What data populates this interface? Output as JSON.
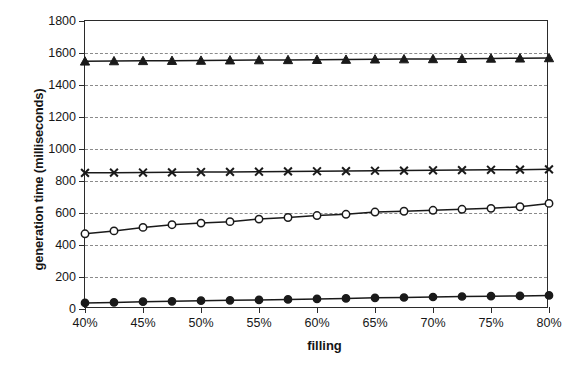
{
  "chart_data": {
    "type": "line",
    "title": "",
    "xlabel": "filling",
    "ylabel": "generation time (milliseconds)",
    "xlim": [
      40,
      80
    ],
    "ylim": [
      0,
      1800
    ],
    "ytick_step": 200,
    "xtick_step": 5,
    "grid": "horizontal-dashed",
    "legend": "none",
    "x": [
      40,
      42.5,
      45,
      47.5,
      50,
      52.5,
      55,
      57.5,
      60,
      62.5,
      65,
      67.5,
      70,
      72.5,
      75,
      77.5,
      80
    ],
    "xtick_labels": [
      "40%",
      "45%",
      "50%",
      "55%",
      "60%",
      "65%",
      "70%",
      "75%",
      "80%"
    ],
    "ytick_labels": [
      "0",
      "200",
      "400",
      "600",
      "800",
      "1000",
      "1200",
      "1400",
      "1600",
      "1800"
    ],
    "series": [
      {
        "name": "triangle-series",
        "marker": "filled-triangle",
        "color": "#1a1a1a",
        "values": [
          1548,
          1550,
          1551,
          1552,
          1553,
          1555,
          1556,
          1557,
          1558,
          1559,
          1561,
          1562,
          1563,
          1564,
          1566,
          1567,
          1569
        ]
      },
      {
        "name": "cross-series",
        "marker": "x-cross",
        "color": "#1a1a1a",
        "values": [
          851,
          852,
          853,
          854,
          856,
          857,
          858,
          860,
          861,
          862,
          864,
          865,
          867,
          868,
          870,
          871,
          873
        ]
      },
      {
        "name": "open-circle-series",
        "marker": "open-circle",
        "color": "#1a1a1a",
        "values": [
          470,
          488,
          510,
          527,
          537,
          546,
          562,
          572,
          584,
          592,
          606,
          611,
          617,
          623,
          629,
          639,
          660
        ]
      },
      {
        "name": "filled-circle-series",
        "marker": "filled-circle",
        "color": "#1a1a1a",
        "values": [
          38,
          41,
          46,
          48,
          52,
          54,
          57,
          60,
          63,
          66,
          70,
          72,
          75,
          78,
          80,
          82,
          85
        ]
      }
    ]
  }
}
